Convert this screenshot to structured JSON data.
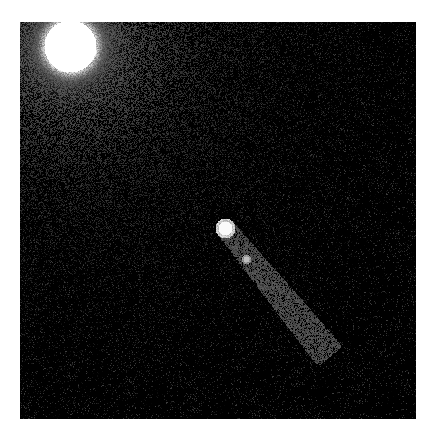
{
  "image": {
    "subject": "Astronomical image: bright star at upper-left and an elongated comet-like object with a bright nucleus and a secondary fragment, with a faint tail extending toward the lower-right",
    "colors": {
      "background": "#030303",
      "bright": "#ffffff",
      "haze": "#4a4a4a"
    }
  },
  "caption": ""
}
